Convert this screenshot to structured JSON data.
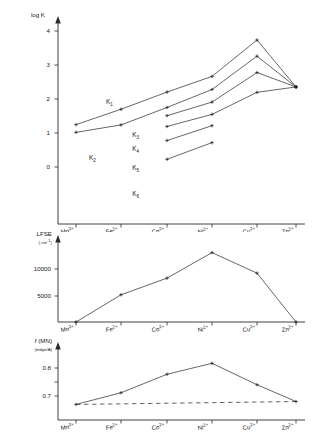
{
  "figure": {
    "categories": [
      "Mn2+",
      "Fe2+",
      "Co2+",
      "Ni2+",
      "Cu2+",
      "Zn2+"
    ],
    "category_labels": [
      {
        "base": "Mn",
        "sup": "2+"
      },
      {
        "base": "Fe",
        "sup": "2+"
      },
      {
        "base": "Co",
        "sup": "2+"
      },
      {
        "base": "Ni",
        "sup": "2+"
      },
      {
        "base": "Cu",
        "sup": "2+"
      },
      {
        "base": "Zn",
        "sup": "2+"
      }
    ]
  },
  "chart_data": [
    {
      "type": "line",
      "panel": "top",
      "title": "",
      "ylabel": "log K",
      "xlabel": "",
      "categories": [
        "Mn2+",
        "Fe2+",
        "Co2+",
        "Ni2+",
        "Cu2+",
        "Zn2+"
      ],
      "ylim": [
        -0.85,
        4.45
      ],
      "yticks": [
        0,
        1,
        2,
        3,
        4
      ],
      "ytick_labels": [
        "0",
        "1",
        "2",
        "3",
        "4"
      ],
      "grid": false,
      "legend": "inline-labels",
      "series": [
        {
          "name": "K1",
          "label_base": "K",
          "label_sub": "1",
          "x": [
            "Mn2+",
            "Fe2+",
            "Co2+",
            "Ni2+",
            "Cu2+",
            "Zn2+"
          ],
          "values": [
            0.8,
            1.4,
            2.07,
            2.68,
            4.1,
            2.27
          ]
        },
        {
          "name": "K2",
          "label_base": "K",
          "label_sub": "2",
          "x": [
            "Mn2+",
            "Fe2+",
            "Co2+",
            "Ni2+",
            "Cu2+",
            "Zn2+"
          ],
          "values": [
            0.5,
            0.79,
            1.47,
            2.17,
            3.47,
            2.27
          ]
        },
        {
          "name": "K3",
          "label_base": "K",
          "label_sub": "3",
          "x": [
            "Co2+",
            "Ni2+",
            "Cu2+",
            "Zn2+"
          ],
          "values": [
            1.15,
            1.68,
            2.83,
            2.27
          ]
        },
        {
          "name": "K4",
          "label_base": "K",
          "label_sub": "4",
          "x": [
            "Co2+",
            "Ni2+",
            "Cu2+",
            "Zn2+"
          ],
          "values": [
            0.73,
            1.2,
            2.06,
            2.27
          ]
        },
        {
          "name": "K5",
          "label_base": "K",
          "label_sub": "5",
          "x": [
            "Co2+",
            "Ni2+"
          ],
          "values": [
            0.18,
            0.76
          ]
        },
        {
          "name": "K6",
          "label_base": "K",
          "label_sub": "6",
          "x": [
            "Co2+",
            "Ni2+"
          ],
          "values": [
            -0.55,
            0.1
          ]
        }
      ]
    },
    {
      "type": "line",
      "panel": "middle",
      "title": "",
      "ylabel": "LFSE",
      "ylabel_units": "( cm",
      "ylabel_units_sup": "-1",
      "ylabel_units_end": ")",
      "xlabel": "",
      "categories": [
        "Mn2+",
        "Fe2+",
        "Co2+",
        "Ni2+",
        "Cu2+",
        "Zn2+"
      ],
      "ylim": [
        0,
        14500
      ],
      "yticks": [
        5000,
        10000
      ],
      "ytick_labels": [
        "5000",
        "10000"
      ],
      "grid": false,
      "series": [
        {
          "name": "LFSE",
          "x": [
            "Mn2+",
            "Fe2+",
            "Co2+",
            "Ni2+",
            "Cu2+",
            "Zn2+"
          ],
          "values": [
            0,
            4900,
            7900,
            12500,
            8800,
            0
          ]
        }
      ]
    },
    {
      "type": "line",
      "panel": "bottom",
      "title": "",
      "ylabel": "f (MN)",
      "ylabel_units": "(mdyn/",
      "ylabel_units_sup": "A",
      "ylabel_units_end": ")",
      "xlabel": "",
      "categories": [
        "Mn2+",
        "Fe2+",
        "Co2+",
        "Ni2+",
        "Cu2+",
        "Zn2+"
      ],
      "ylim": [
        0.645,
        0.875
      ],
      "yticks": [
        0.7,
        0.8
      ],
      "ytick_labels": [
        "0.7",
        "0.8"
      ],
      "grid": false,
      "series": [
        {
          "name": "f-observed",
          "style": "solid",
          "x": [
            "Mn2+",
            "Fe2+",
            "Co2+",
            "Ni2+",
            "Cu2+",
            "Zn2+"
          ],
          "values": [
            0.676,
            0.724,
            0.8,
            0.845,
            0.757,
            0.688
          ]
        },
        {
          "name": "f-baseline",
          "style": "dashed",
          "x": [
            "Mn2+",
            "Zn2+"
          ],
          "values": [
            0.676,
            0.688
          ]
        }
      ]
    }
  ]
}
